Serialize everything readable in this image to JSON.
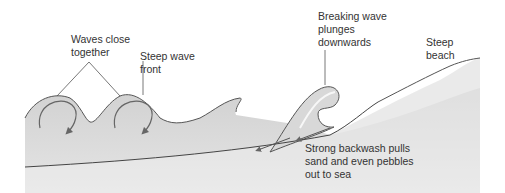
{
  "diagram": {
    "labels": {
      "waves_close": "Waves close\ntogether",
      "steep_front": "Steep wave\nfront",
      "breaking": "Breaking wave\nplunges\ndownwards",
      "steep_beach": "Steep\nbeach",
      "backwash": "Strong backwash pulls\nsand and even pebbles\nout to sea"
    },
    "colors": {
      "water": "#d6d6d6",
      "water_light": "#e8e8e8",
      "line": "#555555",
      "arrow": "#666666",
      "text": "#333333",
      "background": "#ffffff"
    }
  }
}
